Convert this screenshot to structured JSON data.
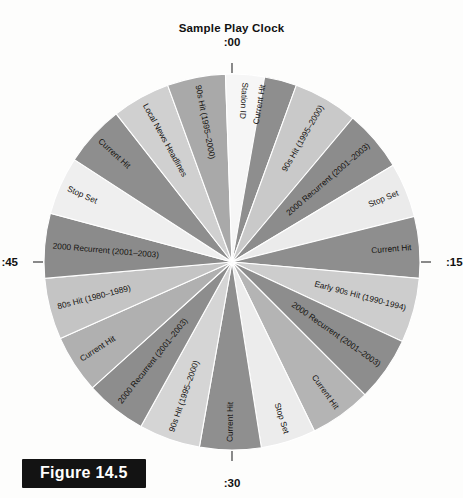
{
  "figure": {
    "title": "Sample Play Clock",
    "caption": "Figure 14.5",
    "caption_bg": "#131313",
    "caption_fg": "#ffffff"
  },
  "clock": {
    "tick_labels": [
      {
        "name": "tick-00",
        "text": ":00",
        "angle": 0
      },
      {
        "name": "tick-15",
        "text": ":15",
        "angle": 90
      },
      {
        "name": "tick-30",
        "text": ":30",
        "angle": 180
      },
      {
        "name": "tick-45",
        "text": ":45",
        "angle": 270
      }
    ],
    "center_x": 232,
    "center_y": 262,
    "radius": 188
  },
  "chart_data": {
    "type": "pie",
    "title": "Sample Play Clock",
    "xlabel": "",
    "ylabel": "",
    "legend": "none",
    "units": "minutes of a 60 minute hour",
    "total_degrees": 360,
    "categories": [
      "Current Hit",
      "90s Hit (1995–2000)",
      "2000 Recurrent (2001–2003)",
      "Stop Set",
      "Current Hit",
      "Early 90s Hit (1990-1994)",
      "2000 Recurrent (2001–2003)",
      "Current Hit",
      "Stop Set",
      "Current Hit",
      "90s Hit (1995–2000)",
      "2000 Recurrent (2001–2003)",
      "Current Hit",
      "80s Hit (1980–1989)",
      "2000 Recurrent (2001–2003)",
      "Stop Set",
      "Current Hit",
      "Local News Headlines",
      "90s Hit (1995–2000)",
      "Station ID"
    ],
    "values": [
      20,
      20,
      19,
      17,
      19,
      20,
      20,
      19,
      17,
      19,
      19,
      19,
      18,
      19,
      20,
      18,
      19,
      18,
      18,
      12
    ],
    "colors": [
      "#8e8e8e",
      "#c9c9c9",
      "#8c8c8c",
      "#ebebeb",
      "#8e8e8e",
      "#cdcdcd",
      "#8d8d8d",
      "#b4b4b4",
      "#ececec",
      "#8f8f8f",
      "#d5d5d5",
      "#8d8d8d",
      "#b0b0b0",
      "#c4c4c4",
      "#8b8b8b",
      "#efefef",
      "#8e8e8e",
      "#d0d0d0",
      "#a9a9a9",
      "#f6f6f6"
    ],
    "slices": [
      {
        "label": "Current Hit",
        "start": 0,
        "sweep": 20,
        "color": "#8e8e8e"
      },
      {
        "label": "90s Hit (1995–2000)",
        "start": 20,
        "sweep": 20,
        "color": "#c9c9c9"
      },
      {
        "label": "2000 Recurrent (2001–2003)",
        "start": 40,
        "sweep": 19,
        "color": "#8c8c8c"
      },
      {
        "label": "Stop Set",
        "start": 59,
        "sweep": 17,
        "color": "#ebebeb"
      },
      {
        "label": "Current Hit",
        "start": 76,
        "sweep": 19,
        "color": "#8e8e8e"
      },
      {
        "label": "Early 90s Hit (1990-1994)",
        "start": 95,
        "sweep": 20,
        "color": "#cdcdcd"
      },
      {
        "label": "2000 Recurrent (2001–2003)",
        "start": 115,
        "sweep": 20,
        "color": "#8d8d8d"
      },
      {
        "label": "Current Hit",
        "start": 135,
        "sweep": 19,
        "color": "#b4b4b4"
      },
      {
        "label": "Stop Set",
        "start": 154,
        "sweep": 17,
        "color": "#ececec"
      },
      {
        "label": "Current Hit",
        "start": 171,
        "sweep": 19,
        "color": "#8f8f8f"
      },
      {
        "label": "90s Hit (1995–2000)",
        "start": 190,
        "sweep": 19,
        "color": "#d5d5d5"
      },
      {
        "label": "2000 Recurrent (2001–2003)",
        "start": 209,
        "sweep": 19,
        "color": "#8d8d8d"
      },
      {
        "label": "Current Hit",
        "start": 228,
        "sweep": 18,
        "color": "#b0b0b0"
      },
      {
        "label": "80s Hit (1980–1989)",
        "start": 246,
        "sweep": 19,
        "color": "#c4c4c4"
      },
      {
        "label": "2000 Recurrent (2001–2003)",
        "start": 265,
        "sweep": 20,
        "color": "#8b8b8b"
      },
      {
        "label": "Stop Set",
        "start": 285,
        "sweep": 18,
        "color": "#efefef"
      },
      {
        "label": "Current Hit",
        "start": 303,
        "sweep": 19,
        "color": "#8e8e8e"
      },
      {
        "label": "Local News Headlines",
        "start": 322,
        "sweep": 18,
        "color": "#d0d0d0"
      },
      {
        "label": "90s Hit (1995–2000)",
        "start": 340,
        "sweep": 18,
        "color": "#a9a9a9"
      },
      {
        "label": "Station ID",
        "start": 358,
        "sweep": 12,
        "color": "#f6f6f6"
      }
    ]
  }
}
